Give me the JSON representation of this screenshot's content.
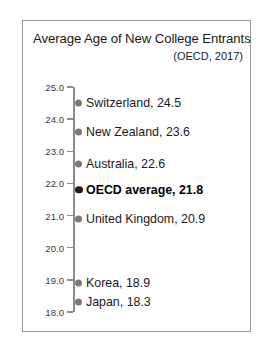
{
  "figure": {
    "title": "Average Age of New College Entrants",
    "subtitle": "(OECD, 2017)"
  },
  "chart_data": {
    "type": "scatter",
    "title": "Average Age of New College Entrants",
    "subtitle": "(OECD, 2017)",
    "xlabel": "",
    "ylabel": "",
    "ylim": [
      18.0,
      25.0
    ],
    "grid": false,
    "legend": "none",
    "yticks": [
      "25.0",
      "24.0",
      "23.0",
      "22.0",
      "21.0",
      "20.0",
      "19.0",
      "18.0"
    ],
    "ytick_values": [
      25.0,
      24.0,
      23.0,
      22.0,
      21.0,
      20.0,
      19.0,
      18.0
    ],
    "categories": [
      "Switzerland",
      "New Zealand",
      "Australia",
      "OECD average",
      "United Kingdom",
      "Korea",
      "Japan"
    ],
    "values": [
      24.5,
      23.6,
      22.6,
      21.8,
      20.9,
      18.9,
      18.3
    ],
    "points": [
      {
        "label": "Switzerland, 24.5",
        "name": "Switzerland",
        "value": 24.5,
        "highlight": false
      },
      {
        "label": "New Zealand, 23.6",
        "name": "New Zealand",
        "value": 23.6,
        "highlight": false
      },
      {
        "label": "Australia, 22.6",
        "name": "Australia",
        "value": 22.6,
        "highlight": false
      },
      {
        "label": "OECD average, 21.8",
        "name": "OECD average",
        "value": 21.8,
        "highlight": true
      },
      {
        "label": "United Kingdom, 20.9",
        "name": "United Kingdom",
        "value": 20.9,
        "highlight": false
      },
      {
        "label": "Korea, 18.9",
        "name": "Korea",
        "value": 18.9,
        "highlight": false
      },
      {
        "label": "Japan, 18.3",
        "name": "Japan",
        "value": 18.3,
        "highlight": false
      }
    ],
    "colors": {
      "marker": "#7a7a7a",
      "marker_highlight": "#1c1c1c",
      "axis": "#8c8c8c",
      "text": "#1a1a1a",
      "border": "#9a9a9a",
      "background": "#ffffff"
    }
  }
}
